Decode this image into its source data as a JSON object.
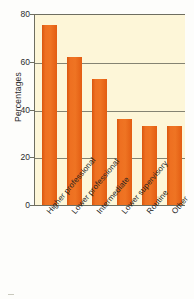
{
  "chart_data": {
    "type": "bar",
    "title": "",
    "subtitle": "",
    "xlabel": "",
    "ylabel": "Percentages",
    "ylim": [
      0,
      80
    ],
    "yticks": [
      0,
      20,
      40,
      60,
      80
    ],
    "ytick_labels": [
      "0",
      "20",
      "40",
      "60",
      "80"
    ],
    "grid": true,
    "legend": false,
    "legend_position": "none",
    "categories": [
      "Higher professional",
      "Lower professional",
      "Intermediate",
      "Lower supervisory",
      "Routine",
      "Other"
    ],
    "values": [
      76,
      62.5,
      53,
      36.5,
      33.5,
      33.5
    ],
    "series": [
      {
        "name": "Percentages",
        "values": [
          76,
          62.5,
          53,
          36.5,
          33.5,
          33.5
        ]
      }
    ],
    "bar_color": "#ee7021",
    "plot_background": "#fdf6d8",
    "axis_color": "#6e6e60",
    "text_color": "#2b2b2b"
  }
}
